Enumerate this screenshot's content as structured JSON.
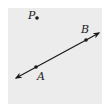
{
  "diagram": {
    "type": "geometry-line-and-point",
    "background_color": "#ececec",
    "ink_color": "#1a1a1a",
    "line": {
      "label": "line AB",
      "through": [
        "A",
        "B"
      ],
      "arrowheads": "both-ends",
      "start": [
        16,
        78
      ],
      "end": [
        99,
        33
      ]
    },
    "points": [
      {
        "label": "A",
        "x": 36,
        "y": 67,
        "on_line": true
      },
      {
        "label": "B",
        "x": 86,
        "y": 40,
        "on_line": true
      },
      {
        "label": "P",
        "x": 37,
        "y": 18,
        "on_line": false
      }
    ],
    "labels": {
      "A": {
        "text": "A",
        "x": 37,
        "y": 80
      },
      "B": {
        "text": "B",
        "x": 81,
        "y": 33
      },
      "P": {
        "text": "P",
        "x": 28,
        "y": 19
      }
    }
  }
}
